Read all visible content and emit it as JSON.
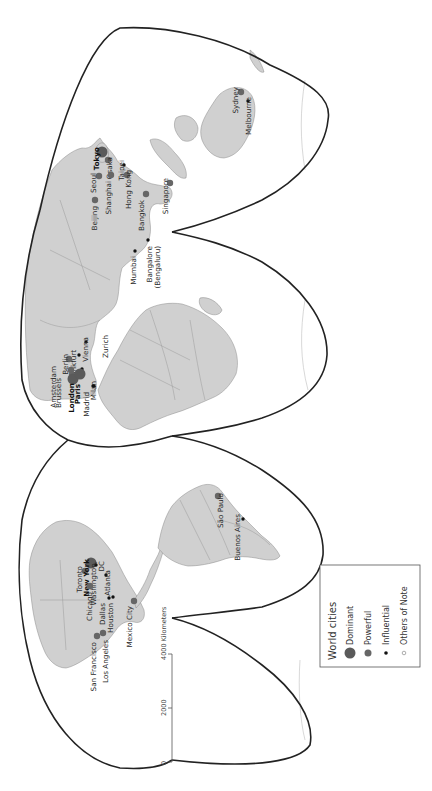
{
  "map": {
    "orientation": "rotated-90-ccw",
    "projection_style": "interrupted homolosine",
    "colors": {
      "land": "#d0d0d0",
      "outline": "#222222",
      "dominant": "#5a5a5a",
      "powerful": "#666666",
      "influential": "#111111",
      "others": "#ffffff"
    }
  },
  "legend": {
    "title": "World cities",
    "items": [
      {
        "label": "Dominant",
        "symbol": "large-gray-circle"
      },
      {
        "label": "Powerful",
        "symbol": "medium-gray-circle"
      },
      {
        "label": "Influential",
        "symbol": "small-black-dot"
      },
      {
        "label": "Others of Note",
        "symbol": "small-open-circle"
      }
    ]
  },
  "scale_bar": {
    "ticks": [
      "0",
      "2000",
      "4000 Kilometers"
    ]
  },
  "cities": [
    {
      "name": "Tokyo",
      "tier": "dominant",
      "x": 102,
      "y": 152,
      "lx": 99,
      "ly": 147
    },
    {
      "name": "Osaka",
      "tier": "powerful",
      "x": 108,
      "y": 160,
      "lx": 112,
      "ly": 157
    },
    {
      "name": "Seoul",
      "tier": "powerful",
      "x": 99,
      "y": 176,
      "lx": 96,
      "ly": 173
    },
    {
      "name": "Taipei",
      "tier": "influential",
      "x": 124,
      "y": 165,
      "lx": 124,
      "ly": 160
    },
    {
      "name": "Shanghai",
      "tier": "powerful",
      "x": 111,
      "y": 175,
      "lx": 111,
      "ly": 181
    },
    {
      "name": "Hong Kong",
      "tier": "powerful",
      "x": 127,
      "y": 175,
      "lx": 131,
      "ly": 170
    },
    {
      "name": "Singapore",
      "tier": "powerful",
      "x": 170,
      "y": 183,
      "lx": 168,
      "ly": 178
    },
    {
      "name": "Beijing",
      "tier": "powerful",
      "x": 95,
      "y": 200,
      "lx": 97,
      "ly": 206
    },
    {
      "name": "Bangkok",
      "tier": "powerful",
      "x": 146,
      "y": 194,
      "lx": 144,
      "ly": 200
    },
    {
      "name": "Mumbai",
      "tier": "influential",
      "x": 135,
      "y": 251,
      "lx": 136,
      "ly": 256
    },
    {
      "name": "Bangalore (Bengaluru)",
      "tier": "influential",
      "x": 148,
      "y": 240,
      "lx": 152,
      "ly": 246
    },
    {
      "name": "Frankfurt",
      "tier": "influential",
      "x": 79,
      "y": 355,
      "lx": 76,
      "ly": 350
    },
    {
      "name": "Berlin",
      "tier": "powerful",
      "x": 69,
      "y": 359,
      "lx": 68,
      "ly": 354
    },
    {
      "name": "Vienna",
      "tier": "influential",
      "x": 86,
      "y": 342,
      "lx": 88,
      "ly": 337
    },
    {
      "name": "Zurich",
      "tier": "influential",
      "x": 82,
      "y": 369,
      "lx": 108,
      "ly": 335
    },
    {
      "name": "Amsterdam",
      "tier": "powerful",
      "x": 71,
      "y": 370,
      "lx": 56,
      "ly": 366
    },
    {
      "name": "Brussels",
      "tier": "powerful",
      "x": 72,
      "y": 375,
      "lx": 61,
      "ly": 378
    },
    {
      "name": "London",
      "tier": "dominant",
      "x": 73,
      "y": 379,
      "lx": 74,
      "ly": 383
    },
    {
      "name": "Paris",
      "tier": "dominant",
      "x": 80,
      "y": 374,
      "lx": 80,
      "ly": 384
    },
    {
      "name": "Milan",
      "tier": "influential",
      "x": 93,
      "y": 386,
      "lx": 96,
      "ly": 381
    },
    {
      "name": "Madrid",
      "tier": "influential",
      "x": 94,
      "y": 386,
      "lx": 89,
      "ly": 392
    },
    {
      "name": "Sydney",
      "tier": "powerful",
      "x": 241,
      "y": 92,
      "lx": 238,
      "ly": 87
    },
    {
      "name": "Melbourne",
      "tier": "influential",
      "x": 248,
      "y": 101,
      "lx": 251,
      "ly": 97
    },
    {
      "name": "Toronto",
      "tier": "powerful",
      "x": 85,
      "y": 571,
      "lx": 82,
      "ly": 566
    },
    {
      "name": "New York",
      "tier": "dominant",
      "x": 91,
      "y": 563,
      "lx": 89,
      "ly": 559
    },
    {
      "name": "Washington, DC",
      "tier": "influential",
      "x": 96,
      "y": 565,
      "lx": 96,
      "ly": 561
    },
    {
      "name": "Atlanta",
      "tier": "influential",
      "x": 106,
      "y": 575,
      "lx": 110,
      "ly": 570
    },
    {
      "name": "Chicago",
      "tier": "powerful",
      "x": 90,
      "y": 586,
      "lx": 92,
      "ly": 592
    },
    {
      "name": "Dallas",
      "tier": "influential",
      "x": 109,
      "y": 598,
      "lx": 105,
      "ly": 603
    },
    {
      "name": "Houston",
      "tier": "influential",
      "x": 113,
      "y": 597,
      "lx": 113,
      "ly": 603
    },
    {
      "name": "San Francisco",
      "tier": "powerful",
      "x": 97,
      "y": 636,
      "lx": 96,
      "ly": 642
    },
    {
      "name": "Los Angeles",
      "tier": "powerful",
      "x": 103,
      "y": 633,
      "lx": 108,
      "ly": 640
    },
    {
      "name": "Mexico City",
      "tier": "powerful",
      "x": 134,
      "y": 601,
      "lx": 132,
      "ly": 606
    },
    {
      "name": "São Paulo",
      "tier": "powerful",
      "x": 218,
      "y": 496,
      "lx": 223,
      "ly": 493
    },
    {
      "name": "Buenos Aires",
      "tier": "influential",
      "x": 243,
      "y": 519,
      "lx": 240,
      "ly": 514
    }
  ]
}
